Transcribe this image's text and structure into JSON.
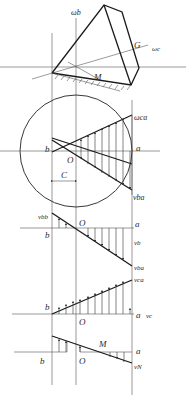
{
  "figure": {
    "top_view": {
      "labels": {
        "omega_b": "ωb",
        "omega_c": "ωc",
        "G": "G",
        "M": "M"
      }
    },
    "circle_view": {
      "labels": {
        "omega_ca": "ωca",
        "b": "b",
        "a": "a",
        "O": "O",
        "C": "C",
        "v_ba": "vba"
      }
    },
    "panel_vb": {
      "labels": {
        "v_bb": "vbb",
        "O": "O",
        "a": "a",
        "b": "b",
        "v_b": "vb",
        "v_ba": "vba"
      }
    },
    "panel_vc": {
      "labels": {
        "v_ca": "vca",
        "b": "b",
        "O": "O",
        "a": "a",
        "v_c": "vc"
      }
    },
    "panel_vN": {
      "labels": {
        "M": "M",
        "a": "a",
        "b": "b",
        "O": "O",
        "v_N": "vN"
      }
    }
  },
  "colors": {
    "line": "#1a1a1a",
    "axis": "#555555",
    "background": "#ffffff"
  }
}
